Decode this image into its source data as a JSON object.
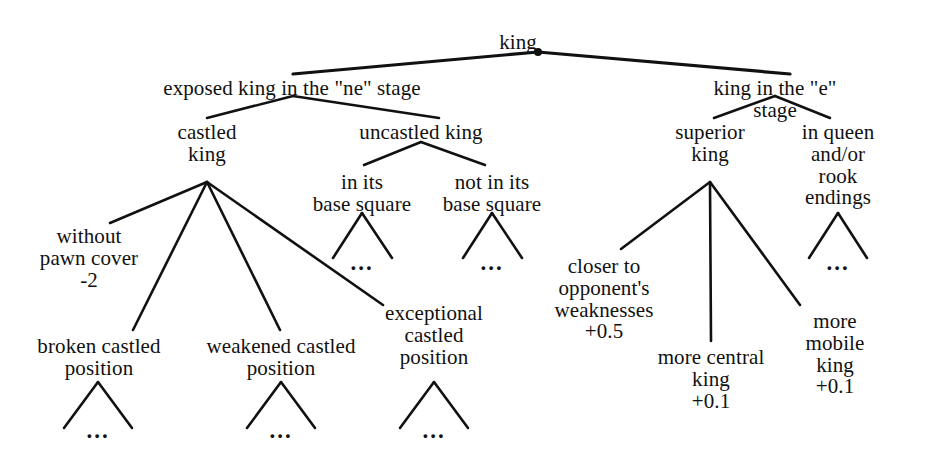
{
  "figure": {
    "title": "king",
    "type": "knowledge-tree-diagram",
    "ink_color": "#111111",
    "background_color": "#ffffff"
  },
  "nodes": {
    "root": {
      "label": "king",
      "x": 518,
      "y": 32
    },
    "exposed_stage": {
      "label": "exposed king in the \"ne\" stage",
      "x": 292,
      "y": 78
    },
    "e_stage": {
      "label": "king in the \"e\" stage",
      "x": 775,
      "y": 78
    },
    "castled_king": {
      "label": "castled\nking",
      "x": 207,
      "y": 122
    },
    "uncastled_king": {
      "label": "uncastled  king",
      "x": 421,
      "y": 122
    },
    "superior_king": {
      "label": "superior\nking",
      "x": 710,
      "y": 122
    },
    "queen_rook_endings": {
      "label": "in queen\nand/or rook\nendings",
      "x": 838,
      "y": 122
    },
    "in_base_square": {
      "label": "in its\nbase square",
      "x": 362,
      "y": 172
    },
    "not_in_base_square": {
      "label": "not in its\nbase square",
      "x": 490,
      "y": 172
    },
    "without_pawn_cover": {
      "label": "without\npawn cover\n-2",
      "x": 89,
      "y": 226
    },
    "closer_to_weaknesses": {
      "label": "closer to\nopponent's\nweaknesses\n+0.5",
      "x": 604,
      "y": 256
    },
    "more_central_king": {
      "label": "more central\nking\n+0.1",
      "x": 711,
      "y": 347
    },
    "more_mobile_king": {
      "label": "more mobile\nking\n+0.1",
      "x": 835,
      "y": 311
    },
    "exceptional_castled": {
      "label": "exceptional\ncastled\nposition",
      "x": 434,
      "y": 303
    },
    "broken_castled": {
      "label": "broken castled\nposition",
      "x": 99,
      "y": 336
    },
    "weakened_castled": {
      "label": "weakened castled\nposition",
      "x": 281,
      "y": 336
    }
  },
  "ellipsis_nodes": [
    {
      "name": "ellipsis-in-base-square",
      "label": "...",
      "x": 362,
      "y": 251
    },
    {
      "name": "ellipsis-not-in-base-square",
      "label": "...",
      "x": 492,
      "y": 251
    },
    {
      "name": "ellipsis-queen-rook-endings",
      "label": "...",
      "x": 838,
      "y": 251
    },
    {
      "name": "ellipsis-broken-castled",
      "label": "...",
      "x": 98,
      "y": 419
    },
    {
      "name": "ellipsis-weakened-castled",
      "label": "...",
      "x": 281,
      "y": 419
    },
    {
      "name": "ellipsis-exceptional-castled",
      "label": "...",
      "x": 434,
      "y": 419
    }
  ],
  "edges": [
    {
      "name": "edge-root-to-exposed-stage",
      "x1": 538,
      "y1": 52,
      "x2": 293,
      "y2": 74
    },
    {
      "name": "edge-root-to-e-stage",
      "x1": 538,
      "y1": 52,
      "x2": 790,
      "y2": 74
    },
    {
      "name": "edge-exposed-to-castled",
      "x1": 293,
      "y1": 96,
      "x2": 207,
      "y2": 118
    },
    {
      "name": "edge-exposed-to-uncastled",
      "x1": 293,
      "y1": 96,
      "x2": 439,
      "y2": 118
    },
    {
      "name": "edge-estage-to-superior",
      "x1": 775,
      "y1": 96,
      "x2": 714,
      "y2": 118
    },
    {
      "name": "edge-estage-to-endings",
      "x1": 775,
      "y1": 96,
      "x2": 830,
      "y2": 118
    },
    {
      "name": "edge-uncastled-to-in-base",
      "x1": 421,
      "y1": 142,
      "x2": 364,
      "y2": 165
    },
    {
      "name": "edge-uncastled-to-not-in-base",
      "x1": 421,
      "y1": 142,
      "x2": 485,
      "y2": 165
    },
    {
      "name": "edge-castled-to-without-pawn",
      "x1": 207,
      "y1": 182,
      "x2": 110,
      "y2": 223
    },
    {
      "name": "edge-castled-to-broken",
      "x1": 207,
      "y1": 182,
      "x2": 133,
      "y2": 330
    },
    {
      "name": "edge-castled-to-weakened",
      "x1": 207,
      "y1": 182,
      "x2": 280,
      "y2": 330
    },
    {
      "name": "edge-castled-to-exceptional",
      "x1": 207,
      "y1": 182,
      "x2": 383,
      "y2": 305
    },
    {
      "name": "edge-superior-to-closer",
      "x1": 710,
      "y1": 182,
      "x2": 621,
      "y2": 249
    },
    {
      "name": "edge-superior-to-more-central",
      "x1": 710,
      "y1": 182,
      "x2": 711,
      "y2": 341
    },
    {
      "name": "edge-superior-to-more-mobile",
      "x1": 710,
      "y1": 182,
      "x2": 800,
      "y2": 305
    },
    {
      "name": "edge-in-base-left",
      "x1": 362,
      "y1": 213,
      "x2": 333,
      "y2": 258
    },
    {
      "name": "edge-in-base-right",
      "x1": 362,
      "y1": 213,
      "x2": 392,
      "y2": 258
    },
    {
      "name": "edge-not-in-base-left",
      "x1": 492,
      "y1": 213,
      "x2": 463,
      "y2": 258
    },
    {
      "name": "edge-not-in-base-right",
      "x1": 492,
      "y1": 213,
      "x2": 522,
      "y2": 258
    },
    {
      "name": "edge-endings-left",
      "x1": 838,
      "y1": 213,
      "x2": 809,
      "y2": 258
    },
    {
      "name": "edge-endings-right",
      "x1": 838,
      "y1": 213,
      "x2": 867,
      "y2": 258
    },
    {
      "name": "edge-broken-left",
      "x1": 98,
      "y1": 382,
      "x2": 64,
      "y2": 428
    },
    {
      "name": "edge-broken-right",
      "x1": 98,
      "y1": 382,
      "x2": 132,
      "y2": 428
    },
    {
      "name": "edge-weakened-left",
      "x1": 281,
      "y1": 382,
      "x2": 247,
      "y2": 428
    },
    {
      "name": "edge-weakened-right",
      "x1": 281,
      "y1": 382,
      "x2": 315,
      "y2": 428
    },
    {
      "name": "edge-exceptional-left",
      "x1": 434,
      "y1": 382,
      "x2": 400,
      "y2": 428
    },
    {
      "name": "edge-exceptional-right",
      "x1": 434,
      "y1": 382,
      "x2": 468,
      "y2": 428
    }
  ],
  "junction_dot": {
    "x": 538,
    "y": 52,
    "r": 4
  },
  "tree_text": {
    "root": "king",
    "level1": [
      "exposed king in the \"ne\" stage",
      "king in the \"e\" stage"
    ],
    "level2": [
      "castled king",
      "uncastled  king",
      "superior king",
      "in queen and/or rook endings"
    ],
    "level3": [
      "in its base square",
      "not in its base square",
      "without pawn cover -2",
      "broken castled position",
      "weakened castled position",
      "exceptional castled position",
      "closer to opponent's weaknesses +0.5",
      "more central king +0.1",
      "more mobile king +0.1"
    ],
    "leaf_marker": "..."
  },
  "scores": {
    "without_pawn_cover": "-2",
    "closer_to_opponents_weaknesses": "+0.5",
    "more_central_king": "+0.1",
    "more_mobile_king": "+0.1"
  }
}
